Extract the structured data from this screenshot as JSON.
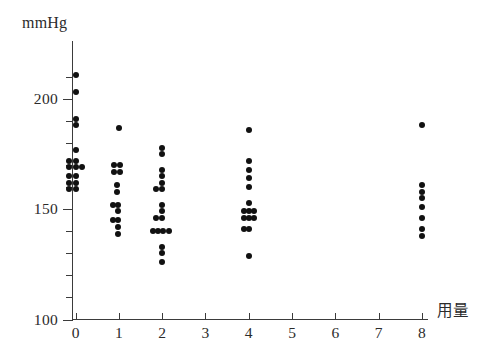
{
  "chart_data": {
    "type": "scatter",
    "title": "",
    "xlabel": "用量",
    "ylabel": "mmHg",
    "xlim": [
      -0.5,
      8.6
    ],
    "ylim": [
      100,
      215
    ],
    "grid": false,
    "legend": null,
    "x_ticks": [
      0,
      1,
      2,
      3,
      4,
      5,
      6,
      7,
      8
    ],
    "x_tick_labels": [
      "0",
      "1",
      "2",
      "3",
      "4",
      "5",
      "6",
      "7",
      "8"
    ],
    "y_ticks": [
      100,
      110,
      120,
      130,
      140,
      150,
      160,
      170,
      180,
      190,
      200,
      210
    ],
    "y_tick_labels_major": [
      "100",
      "150",
      "200"
    ],
    "y_major_ticks": [
      100,
      150,
      200
    ],
    "y_minor_ticks": [
      110,
      120,
      130,
      140,
      160,
      170,
      180,
      190,
      210
    ],
    "series": [
      {
        "name": "用量 0",
        "x": 0,
        "points": [
          {
            "x": 0.0,
            "y": 211
          },
          {
            "x": 0.0,
            "y": 203
          },
          {
            "x": 0.0,
            "y": 191
          },
          {
            "x": 0.0,
            "y": 188
          },
          {
            "x": 0.0,
            "y": 177
          },
          {
            "x": -0.14,
            "y": 172
          },
          {
            "x": 0.0,
            "y": 172
          },
          {
            "x": -0.14,
            "y": 169
          },
          {
            "x": 0.0,
            "y": 169
          },
          {
            "x": 0.14,
            "y": 169
          },
          {
            "x": -0.14,
            "y": 165
          },
          {
            "x": 0.0,
            "y": 165
          },
          {
            "x": -0.14,
            "y": 162
          },
          {
            "x": 0.0,
            "y": 162
          },
          {
            "x": -0.14,
            "y": 159
          },
          {
            "x": 0.0,
            "y": 159
          }
        ]
      },
      {
        "name": "用量 1",
        "x": 1,
        "points": [
          {
            "x": 1.0,
            "y": 187
          },
          {
            "x": 0.88,
            "y": 170
          },
          {
            "x": 1.02,
            "y": 170
          },
          {
            "x": 0.88,
            "y": 167
          },
          {
            "x": 1.02,
            "y": 167
          },
          {
            "x": 0.95,
            "y": 161
          },
          {
            "x": 0.95,
            "y": 158
          },
          {
            "x": 0.86,
            "y": 152
          },
          {
            "x": 0.99,
            "y": 152
          },
          {
            "x": 0.99,
            "y": 149
          },
          {
            "x": 0.86,
            "y": 145
          },
          {
            "x": 0.99,
            "y": 145
          },
          {
            "x": 0.99,
            "y": 142
          },
          {
            "x": 0.99,
            "y": 139
          }
        ]
      },
      {
        "name": "用量 2",
        "x": 2,
        "points": [
          {
            "x": 2.0,
            "y": 178
          },
          {
            "x": 2.0,
            "y": 175
          },
          {
            "x": 2.0,
            "y": 168
          },
          {
            "x": 2.0,
            "y": 165
          },
          {
            "x": 2.0,
            "y": 162
          },
          {
            "x": 1.87,
            "y": 159
          },
          {
            "x": 2.0,
            "y": 159
          },
          {
            "x": 2.0,
            "y": 152
          },
          {
            "x": 2.0,
            "y": 149
          },
          {
            "x": 1.87,
            "y": 146
          },
          {
            "x": 2.0,
            "y": 146
          },
          {
            "x": 1.79,
            "y": 140
          },
          {
            "x": 1.91,
            "y": 140
          },
          {
            "x": 2.03,
            "y": 140
          },
          {
            "x": 2.15,
            "y": 140
          },
          {
            "x": 2.0,
            "y": 133
          },
          {
            "x": 2.0,
            "y": 130
          },
          {
            "x": 2.0,
            "y": 126
          }
        ]
      },
      {
        "name": "用量 4",
        "x": 4,
        "points": [
          {
            "x": 4.0,
            "y": 186
          },
          {
            "x": 4.0,
            "y": 172
          },
          {
            "x": 4.0,
            "y": 168
          },
          {
            "x": 4.0,
            "y": 164
          },
          {
            "x": 4.0,
            "y": 160
          },
          {
            "x": 4.0,
            "y": 153
          },
          {
            "x": 3.88,
            "y": 149
          },
          {
            "x": 4.0,
            "y": 149
          },
          {
            "x": 4.12,
            "y": 149
          },
          {
            "x": 3.88,
            "y": 146
          },
          {
            "x": 4.0,
            "y": 146
          },
          {
            "x": 4.12,
            "y": 146
          },
          {
            "x": 3.88,
            "y": 141
          },
          {
            "x": 4.0,
            "y": 141
          },
          {
            "x": 4.0,
            "y": 129
          }
        ]
      },
      {
        "name": "用量 8",
        "x": 8,
        "points": [
          {
            "x": 8.0,
            "y": 188
          },
          {
            "x": 8.0,
            "y": 161
          },
          {
            "x": 8.0,
            "y": 158
          },
          {
            "x": 8.0,
            "y": 155
          },
          {
            "x": 8.0,
            "y": 151
          },
          {
            "x": 8.0,
            "y": 146
          },
          {
            "x": 8.0,
            "y": 141
          },
          {
            "x": 8.0,
            "y": 138
          }
        ]
      }
    ]
  },
  "axes": {
    "y_title": "mmHg",
    "x_title": "用量"
  }
}
